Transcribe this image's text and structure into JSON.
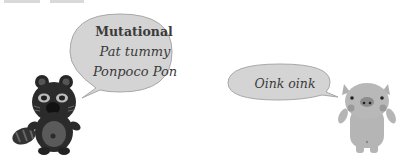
{
  "scene": {
    "background": "#ffffff",
    "left_character": {
      "name": "raccoon-dog",
      "color": "#2b2b2b",
      "speech_bubble": {
        "title": "Mutational",
        "line2": "Pat tummy",
        "line3": "Ponpoco Pon",
        "fill": "#d4d4d4",
        "stroke": "#a8a8a8"
      }
    },
    "right_character": {
      "name": "pig",
      "color": "#b5b5b5",
      "speech_bubble": {
        "text": "Oink oink",
        "fill": "#d4d4d4",
        "stroke": "#a8a8a8"
      }
    }
  }
}
